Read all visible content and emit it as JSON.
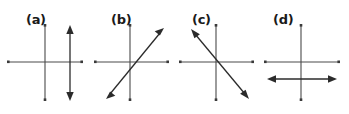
{
  "figure": {
    "background_color": "#ffffff",
    "axis_color": "#4a4a4a",
    "vector_color": "#2b2b2b",
    "label_color": "#1a1a1a",
    "width": 349,
    "height": 114,
    "panel_count": 4
  },
  "panels": [
    {
      "id": "a",
      "label": "(a)",
      "label_x": 26,
      "label_y": 24,
      "origin_x": 45,
      "origin_y": 62,
      "h_axis": {
        "x1": 8,
        "y1": 62,
        "x2": 82,
        "y2": 62
      },
      "v_axis": {
        "x1": 45,
        "y1": 25,
        "x2": 45,
        "y2": 100
      },
      "vector": {
        "orientation": "vertical",
        "x1": 70,
        "y1": 25,
        "x2": 70,
        "y2": 100,
        "double_headed": true,
        "description": "vertical double arrow offset right of vertical axis"
      }
    },
    {
      "id": "b",
      "label": "(b)",
      "label_x": 111,
      "label_y": 24,
      "origin_x": 130,
      "origin_y": 62,
      "h_axis": {
        "x1": 95,
        "y1": 62,
        "x2": 168,
        "y2": 62
      },
      "v_axis": {
        "x1": 130,
        "y1": 25,
        "x2": 130,
        "y2": 100
      },
      "vector": {
        "orientation": "diagonal-positive",
        "x1": 106,
        "y1": 99,
        "x2": 164,
        "y2": 28,
        "double_headed": true,
        "description": "diagonal double arrow from lower-left to upper-right"
      }
    },
    {
      "id": "c",
      "label": "(c)",
      "label_x": 192,
      "label_y": 24,
      "origin_x": 216,
      "origin_y": 62,
      "h_axis": {
        "x1": 180,
        "y1": 62,
        "x2": 253,
        "y2": 62
      },
      "v_axis": {
        "x1": 216,
        "y1": 25,
        "x2": 216,
        "y2": 100
      },
      "vector": {
        "orientation": "diagonal-negative",
        "x1": 191,
        "y1": 29,
        "x2": 249,
        "y2": 99,
        "double_headed": true,
        "description": "diagonal double arrow from upper-left to lower-right"
      }
    },
    {
      "id": "d",
      "label": "(d)",
      "label_x": 273,
      "label_y": 24,
      "origin_x": 301,
      "origin_y": 62,
      "h_axis": {
        "x1": 265,
        "y1": 62,
        "x2": 339,
        "y2": 62
      },
      "v_axis": {
        "x1": 301,
        "y1": 25,
        "x2": 301,
        "y2": 100
      },
      "vector": {
        "orientation": "horizontal",
        "x1": 267,
        "y1": 79,
        "x2": 337,
        "y2": 79,
        "double_headed": true,
        "description": "horizontal double arrow offset below horizontal axis"
      }
    }
  ]
}
